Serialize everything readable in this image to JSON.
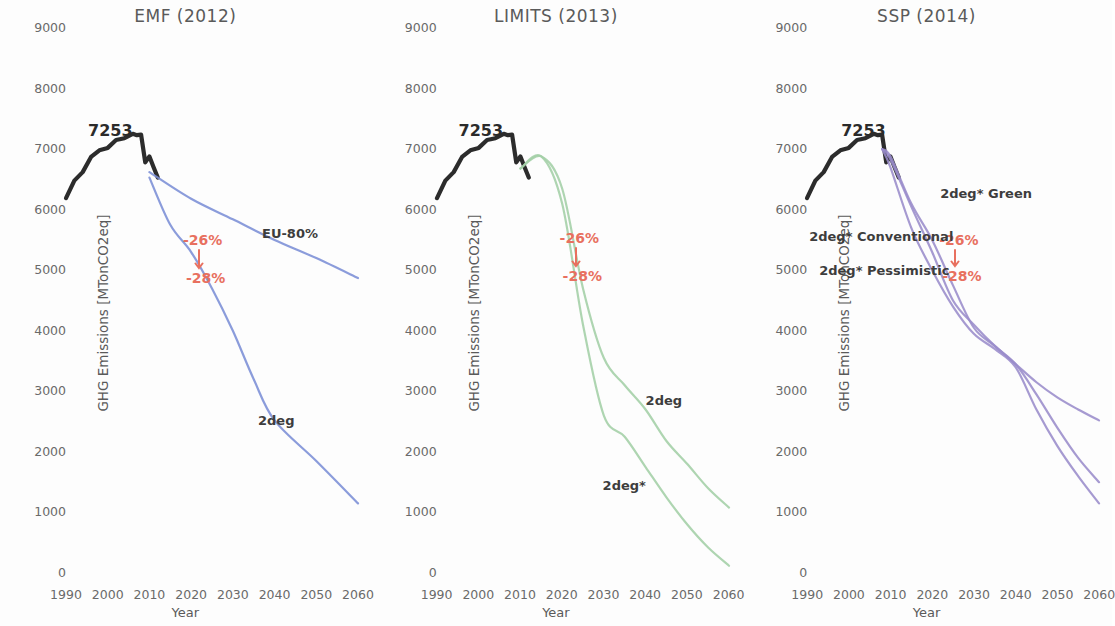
{
  "figure": {
    "panel_count": 3,
    "background": "#fdfdfd"
  },
  "axis": {
    "ylabel": "GHG Emissions [MTonCO2eq]",
    "xlabel": "Year",
    "yticks": [
      "0",
      "1000",
      "2000",
      "3000",
      "4000",
      "5000",
      "6000",
      "7000",
      "8000",
      "9000"
    ],
    "xticks": [
      "1990",
      "2000",
      "2010",
      "2020",
      "2030",
      "2040",
      "2050",
      "2060"
    ],
    "ylim": [
      0,
      9000
    ],
    "xlim": [
      1990,
      2060
    ]
  },
  "colors": {
    "historical": "#1a1a1a",
    "emf_blue": "#7b8ed6",
    "limits_green": "#a3cfa6",
    "ssp_purple": "#9a8ccb",
    "annotation_red": "#e8705f",
    "tick_text": "#6a6a6a",
    "title_text": "#5a5a5a"
  },
  "annotations": {
    "peak_value": "7253",
    "reduction_upper": "-26%",
    "reduction_lower": "-28%"
  },
  "panels": [
    {
      "id": "emf",
      "title": "EMF (2012)",
      "curve_labels": [
        {
          "text": "EU-80%",
          "x": 262,
          "y": 226
        },
        {
          "text": "2deg",
          "x": 258,
          "y": 413
        }
      ],
      "peak_label": {
        "x": 88,
        "y": 121
      },
      "annotation": {
        "x": 183,
        "y": 232,
        "x2": 186,
        "y2": 270,
        "arrow_x": 199,
        "arrow_y1": 250,
        "arrow_y2": 268
      }
    },
    {
      "id": "limits",
      "title": "LIMITS (2013)",
      "curve_labels": [
        {
          "text": "2deg",
          "x": 275,
          "y": 393
        },
        {
          "text": "2deg*",
          "x": 232,
          "y": 478
        }
      ],
      "peak_label": {
        "x": 88,
        "y": 121
      },
      "annotation": {
        "x": 189,
        "y": 230,
        "x2": 192,
        "y2": 268,
        "arrow_x": 205,
        "arrow_y1": 248,
        "arrow_y2": 266
      }
    },
    {
      "id": "ssp",
      "title": "SSP (2014)",
      "curve_labels": [
        {
          "text": "2deg* Green",
          "x": 199,
          "y": 186
        },
        {
          "text": "2deg* Conventional",
          "x": 68,
          "y": 229
        },
        {
          "text": "2deg* Pessimistic",
          "x": 78,
          "y": 263
        }
      ],
      "peak_label": {
        "x": 100,
        "y": 121
      },
      "annotation": {
        "x": 198,
        "y": 232,
        "x2": 201,
        "y2": 268,
        "arrow_x": 214,
        "arrow_y1": 250,
        "arrow_y2": 266
      }
    }
  ],
  "chart_data": {
    "type": "line",
    "xlabel": "Year",
    "ylabel": "GHG Emissions [MTonCO2eq]",
    "xlim": [
      1990,
      2060
    ],
    "ylim": [
      0,
      9000
    ],
    "grid": false,
    "legend": "inline-labels",
    "x": [
      1990,
      1995,
      2000,
      2005,
      2010,
      2015,
      2020,
      2025,
      2030,
      2035,
      2040,
      2045,
      2050,
      2055,
      2060
    ],
    "subplots": [
      {
        "name": "EMF (2012)",
        "color": "#7b8ed6",
        "series": [
          {
            "name": "Historical",
            "color": "#1a1a1a",
            "x": [
              1990,
              1992,
              1994,
              1996,
              1998,
              2000,
              2002,
              2004,
              2006,
              2007,
              2008,
              2009,
              2010,
              2011,
              2012
            ],
            "values": [
              6190,
              6480,
              6620,
              6870,
              6980,
              7020,
              7150,
              7180,
              7253,
              7230,
              7240,
              6780,
              6880,
              6700,
              6530
            ]
          },
          {
            "name": "EU-80%",
            "color": "#7b8ed6",
            "x": [
              2010,
              2020,
              2030,
              2040,
              2050,
              2060
            ],
            "values": [
              6620,
              6180,
              5840,
              5500,
              5200,
              4870
            ]
          },
          {
            "name": "2deg",
            "color": "#7b8ed6",
            "x": [
              2010,
              2015,
              2020,
              2025,
              2030,
              2035,
              2040,
              2050,
              2060
            ],
            "values": [
              6530,
              5750,
              5300,
              4700,
              4000,
              3200,
              2520,
              1850,
              1150
            ]
          }
        ],
        "annotations": [
          {
            "text": "7253",
            "x": 2006,
            "y": 7253
          },
          {
            "text": "-26%",
            "x": 2024,
            "y": 5480
          },
          {
            "text": "-28%",
            "x": 2024,
            "y": 5090
          }
        ]
      },
      {
        "name": "LIMITS (2013)",
        "color": "#a3cfa6",
        "series": [
          {
            "name": "Historical",
            "color": "#1a1a1a",
            "x": [
              1990,
              1992,
              1994,
              1996,
              1998,
              2000,
              2002,
              2004,
              2006,
              2007,
              2008,
              2009,
              2010,
              2011,
              2012
            ],
            "values": [
              6190,
              6480,
              6620,
              6870,
              6980,
              7020,
              7150,
              7180,
              7253,
              7230,
              7240,
              6780,
              6880,
              6700,
              6530
            ]
          },
          {
            "name": "2deg",
            "color": "#a3cfa6",
            "x": [
              2010,
              2015,
              2020,
              2025,
              2030,
              2035,
              2040,
              2045,
              2050,
              2055,
              2060
            ],
            "values": [
              6680,
              6880,
              6350,
              4700,
              3550,
              3100,
              2700,
              2180,
              1800,
              1400,
              1080
            ]
          },
          {
            "name": "2deg*",
            "color": "#a3cfa6",
            "x": [
              2010,
              2015,
              2020,
              2025,
              2030,
              2035,
              2040,
              2045,
              2050,
              2055,
              2060
            ],
            "values": [
              6680,
              6880,
              6100,
              4100,
              2600,
              2250,
              1750,
              1250,
              800,
              420,
              120
            ]
          }
        ],
        "annotations": [
          {
            "text": "7253",
            "x": 2006,
            "y": 7253
          },
          {
            "text": "-26%",
            "x": 2025,
            "y": 5510
          },
          {
            "text": "-28%",
            "x": 2025,
            "y": 5120
          }
        ]
      },
      {
        "name": "SSP (2014)",
        "color": "#9a8ccb",
        "series": [
          {
            "name": "Historical",
            "color": "#1a1a1a",
            "x": [
              1990,
              1992,
              1994,
              1996,
              1998,
              2000,
              2002,
              2004,
              2006,
              2007,
              2008,
              2009,
              2010,
              2011,
              2012
            ],
            "values": [
              6190,
              6480,
              6620,
              6870,
              6980,
              7020,
              7150,
              7180,
              7253,
              7230,
              7240,
              6780,
              6880,
              6700,
              6530
            ]
          },
          {
            "name": "2deg* Green",
            "color": "#9a8ccb",
            "x": [
              2008,
              2010,
              2015,
              2020,
              2025,
              2030,
              2035,
              2040,
              2045,
              2050,
              2055,
              2060
            ],
            "values": [
              7000,
              6880,
              6100,
              5500,
              4750,
              4050,
              3750,
              3450,
              3150,
              2900,
              2700,
              2520
            ]
          },
          {
            "name": "2deg* Conventional",
            "color": "#9a8ccb",
            "x": [
              2008,
              2010,
              2015,
              2020,
              2025,
              2030,
              2035,
              2040,
              2045,
              2050,
              2055,
              2060
            ],
            "values": [
              7000,
              6830,
              6050,
              5300,
              4500,
              4100,
              3750,
              3450,
              2950,
              2400,
              1900,
              1500
            ]
          },
          {
            "name": "2deg* Pessimistic",
            "color": "#9a8ccb",
            "x": [
              2008,
              2010,
              2015,
              2020,
              2025,
              2030,
              2035,
              2040,
              2045,
              2050,
              2055,
              2060
            ],
            "values": [
              7000,
              6700,
              5700,
              5000,
              4400,
              3950,
              3700,
              3400,
              2700,
              2100,
              1600,
              1150
            ]
          }
        ],
        "annotations": [
          {
            "text": "7253",
            "x": 2006,
            "y": 7253
          },
          {
            "text": "-26%",
            "x": 2027,
            "y": 5480
          },
          {
            "text": "-28%",
            "x": 2027,
            "y": 5090
          }
        ]
      }
    ]
  }
}
